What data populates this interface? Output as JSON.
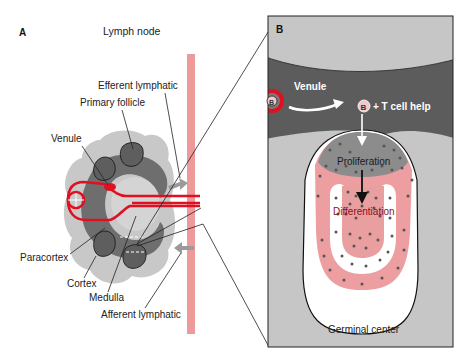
{
  "panel_a": {
    "letter": "A",
    "title": "Lymph node",
    "labels": {
      "efferent": "Efferent lymphatic",
      "primary_follicle": "Primary follicle",
      "venule": "Venule",
      "paracortex": "Paracortex",
      "cortex": "Cortex",
      "medulla": "Medulla",
      "afferent": "Afferent lymphatic"
    }
  },
  "panel_b": {
    "letter": "B",
    "venule": "Venule",
    "b_cell": "B",
    "t_cell_help": "+ T cell help",
    "proliferation": "Proliferation",
    "differentiation": "Differentiation",
    "germinal_center": "Germinal center"
  },
  "colors": {
    "light_gray": "#c8c8c8",
    "mid_gray": "#8c8c8c",
    "dark_gray": "#5a5a5a",
    "red": "#e01020",
    "pink": "#ee9a9a",
    "panel_bg": "#c6c6c6",
    "venule_band": "#5c5c5c"
  }
}
